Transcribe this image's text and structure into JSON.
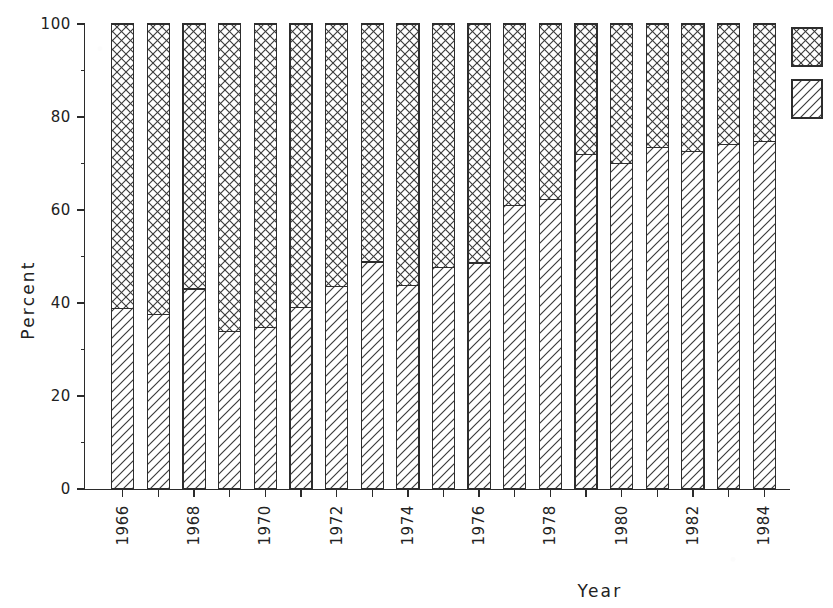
{
  "chart_data": {
    "type": "bar",
    "subtype": "stacked-bar-100-percent",
    "title": "",
    "xlabel": "Year",
    "ylabel": "Percent",
    "ylim": [
      0,
      100
    ],
    "yticks": [
      0,
      20,
      40,
      60,
      80,
      100
    ],
    "ytick_labels": [
      "0",
      "20",
      "40",
      "60",
      "80",
      "100"
    ],
    "grid": false,
    "legend_position": "right",
    "legend_entries": [
      {
        "name": "series-crosshatch",
        "label": "",
        "pattern": "crosshatch"
      },
      {
        "name": "series-diagonal",
        "label": "",
        "pattern": "diagonal"
      }
    ],
    "categories": [
      1966,
      1967,
      1968,
      1969,
      1970,
      1971,
      1972,
      1973,
      1974,
      1975,
      1976,
      1977,
      1978,
      1979,
      1980,
      1981,
      1982,
      1983,
      1984
    ],
    "xtick_labels": [
      "1966",
      "",
      "1968",
      "",
      "1970",
      "",
      "1972",
      "",
      "1974",
      "",
      "1976",
      "",
      "1978",
      "",
      "1980",
      "",
      "1982",
      "",
      "1984"
    ],
    "xtick_labels_rotated": true,
    "series": [
      {
        "name": "diagonal",
        "pattern": "diagonal",
        "values": [
          38.8,
          37.6,
          43.0,
          33.8,
          34.8,
          39.0,
          43.5,
          48.8,
          43.8,
          47.6,
          48.6,
          61.0,
          62.3,
          72.0,
          70.0,
          73.5,
          72.5,
          74.0,
          74.8
        ]
      },
      {
        "name": "crosshatch",
        "pattern": "crosshatch",
        "values": [
          61.2,
          62.4,
          57.0,
          66.2,
          65.2,
          61.0,
          56.5,
          51.2,
          56.2,
          52.4,
          51.4,
          39.0,
          37.7,
          28.0,
          30.0,
          26.5,
          27.5,
          26.0,
          25.2
        ]
      }
    ]
  },
  "colors": {
    "ink": "#2b2b2b",
    "paper": "#ffffff",
    "hatch": "#3a3a3a"
  },
  "axis": {
    "y_title": "Percent",
    "x_title": "Year"
  }
}
